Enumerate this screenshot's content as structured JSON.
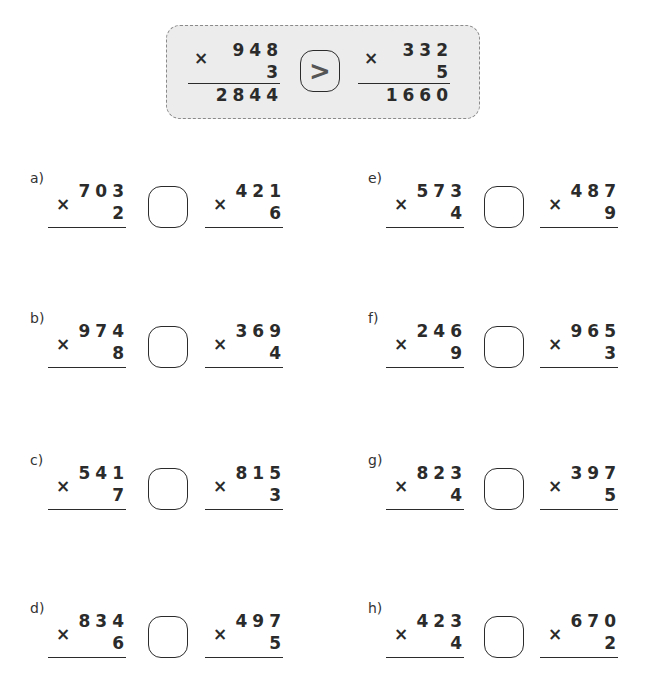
{
  "example": {
    "left": {
      "top": "948",
      "bottom": "3",
      "result": "2844"
    },
    "comparison": ">",
    "right": {
      "top": "332",
      "bottom": "5",
      "result": "1660"
    }
  },
  "operator": "×",
  "problems": [
    {
      "label": "a)",
      "left": {
        "top": "703",
        "bottom": "2"
      },
      "right": {
        "top": "421",
        "bottom": "6"
      },
      "answer": ""
    },
    {
      "label": "b)",
      "left": {
        "top": "974",
        "bottom": "8"
      },
      "right": {
        "top": "369",
        "bottom": "4"
      },
      "answer": ""
    },
    {
      "label": "c)",
      "left": {
        "top": "541",
        "bottom": "7"
      },
      "right": {
        "top": "815",
        "bottom": "3"
      },
      "answer": ""
    },
    {
      "label": "d)",
      "left": {
        "top": "834",
        "bottom": "6"
      },
      "right": {
        "top": "497",
        "bottom": "5"
      },
      "answer": ""
    },
    {
      "label": "e)",
      "left": {
        "top": "573",
        "bottom": "4"
      },
      "right": {
        "top": "487",
        "bottom": "9"
      },
      "answer": ""
    },
    {
      "label": "f)",
      "left": {
        "top": "246",
        "bottom": "9"
      },
      "right": {
        "top": "965",
        "bottom": "3"
      },
      "answer": ""
    },
    {
      "label": "g)",
      "left": {
        "top": "823",
        "bottom": "4"
      },
      "right": {
        "top": "397",
        "bottom": "5"
      },
      "answer": ""
    },
    {
      "label": "h)",
      "left": {
        "top": "423",
        "bottom": "4"
      },
      "right": {
        "top": "670",
        "bottom": "2"
      },
      "answer": ""
    }
  ]
}
